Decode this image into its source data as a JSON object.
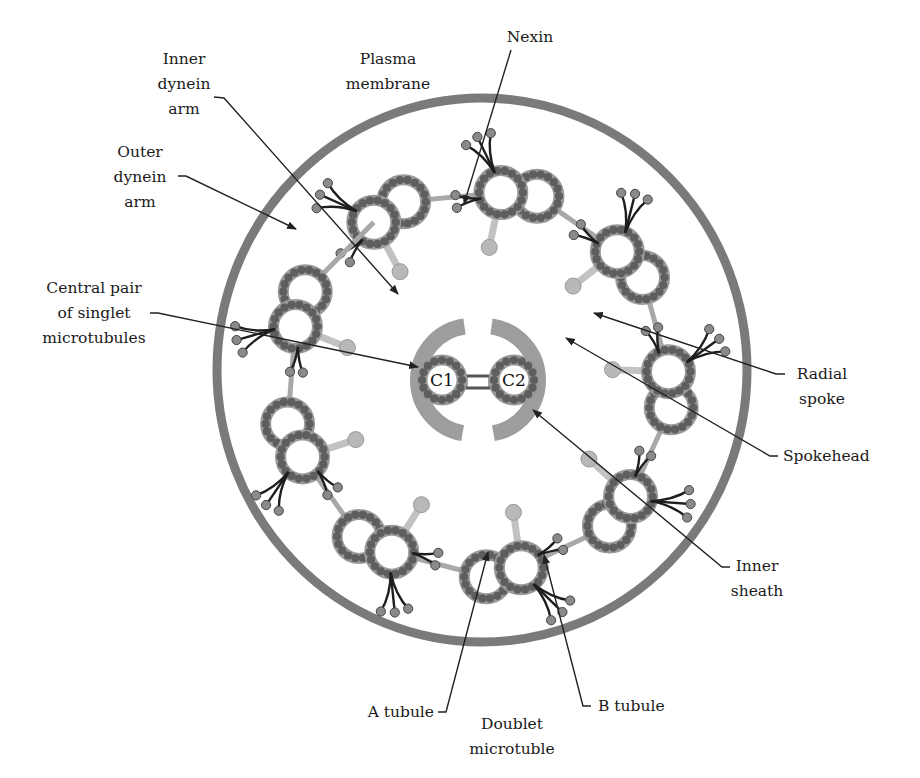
{
  "colors": {
    "membrane": "#7a7a7a",
    "tubule_ring": "#9a9a9a",
    "tubule_dot": "#5e5e5e",
    "dynein_arm": "#1e1e1e",
    "spoke": "#c2c2c2",
    "spokehead": "#b8b8b8",
    "inner_sheath": "#9d9d9d",
    "leader": "#222222",
    "text": "#1a1a1a"
  },
  "geometry": {
    "membrane": {
      "cx": 482,
      "cy": 370,
      "rx": 265,
      "ry": 272,
      "stroke_width": 9
    },
    "center": {
      "cx": 478,
      "cy": 382
    },
    "doublet_ring_radius": 190,
    "doublet_count": 9,
    "doublet_start_angle_deg": -118
  },
  "central_pair": {
    "c1_label": "C1",
    "c2_label": "C2"
  },
  "labels": {
    "inner_dynein_arm": [
      "Inner",
      "dynein",
      "arm"
    ],
    "plasma_membrane": [
      "Plasma",
      "membrane"
    ],
    "nexin": [
      "Nexin"
    ],
    "outer_dynein_arm": [
      "Outer",
      "dynein",
      "arm"
    ],
    "central_pair": [
      "Central pair",
      "of singlet",
      "microtubules"
    ],
    "radial_spoke": [
      "Radial",
      "spoke"
    ],
    "spokehead": [
      "Spokehead"
    ],
    "inner_sheath": [
      "Inner",
      "sheath"
    ],
    "a_tubule": [
      "A tubule"
    ],
    "b_tubule": [
      "B tubule"
    ],
    "doublet_microtubule": [
      "Doublet",
      "microtuble"
    ]
  }
}
